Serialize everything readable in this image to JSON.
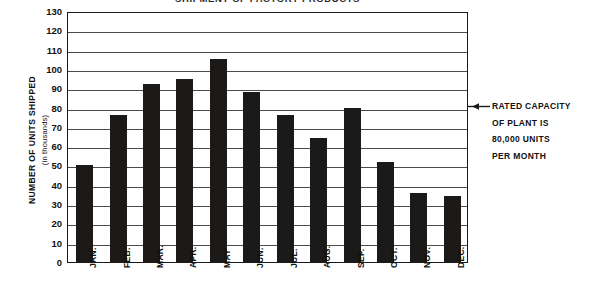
{
  "chart_data": {
    "type": "bar",
    "title": "SHIPMENT OF FACTORY PRODUCTS",
    "xlabel": "",
    "ylabel": "NUMBER OF UNITS SHIPPED",
    "ylabel_sub": "(in thousands)",
    "ylim": [
      0,
      130
    ],
    "ytick_step": 10,
    "yticks": [
      130,
      120,
      110,
      100,
      90,
      80,
      70,
      60,
      50,
      40,
      30,
      20,
      10,
      0
    ],
    "categories": [
      "JAN.",
      "FEB.",
      "MAR.",
      "APR.",
      "MAY",
      "JUN.",
      "JUL.",
      "AUG.",
      "SEP.",
      "OCT.",
      "NOV.",
      "DEC."
    ],
    "values": [
      50,
      76,
      92,
      95,
      105,
      88,
      76,
      64,
      80,
      52,
      36,
      34
    ],
    "grid": true,
    "legend": false,
    "bar_color": "#1c1a18",
    "annotations": [
      {
        "text_lines": [
          "RATED CAPACITY",
          "OF PLANT IS",
          "80,000 UNITS",
          "PER MONTH"
        ],
        "points_to_value": 80,
        "position": "right"
      }
    ]
  },
  "annotation": {
    "line1": "RATED CAPACITY",
    "line2": "OF PLANT IS",
    "line3": "80,000 UNITS",
    "line4": "PER MONTH"
  }
}
